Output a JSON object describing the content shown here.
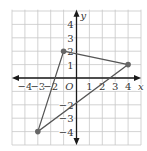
{
  "diagram": {
    "type": "coordinate-plane-triangle",
    "x_range": [
      -5,
      5
    ],
    "y_range": [
      -5,
      5
    ],
    "axis_labels": {
      "x": "x",
      "y": "y",
      "origin": "O"
    },
    "x_ticks": [
      {
        "v": -4,
        "label": "−4"
      },
      {
        "v": -3,
        "label": "−3"
      },
      {
        "v": -2,
        "label": "−2"
      },
      {
        "v": 1,
        "label": "1"
      },
      {
        "v": 2,
        "label": "2"
      },
      {
        "v": 3,
        "label": "3"
      },
      {
        "v": 4,
        "label": "4"
      }
    ],
    "y_ticks": [
      {
        "v": 4,
        "label": "4"
      },
      {
        "v": 3,
        "label": "3"
      },
      {
        "v": 2,
        "label": "2"
      },
      {
        "v": 1,
        "label": "1"
      },
      {
        "v": -2,
        "label": "−2"
      },
      {
        "v": -3,
        "label": "−3"
      },
      {
        "v": -4,
        "label": "−4"
      }
    ],
    "vertices": [
      [
        -1,
        2
      ],
      [
        4,
        1
      ],
      [
        -3,
        -4
      ]
    ],
    "colors": {
      "grid": "#c8c8c8",
      "axis": "#1a1a1a",
      "triangle": "#555555",
      "point": "#666666"
    }
  }
}
